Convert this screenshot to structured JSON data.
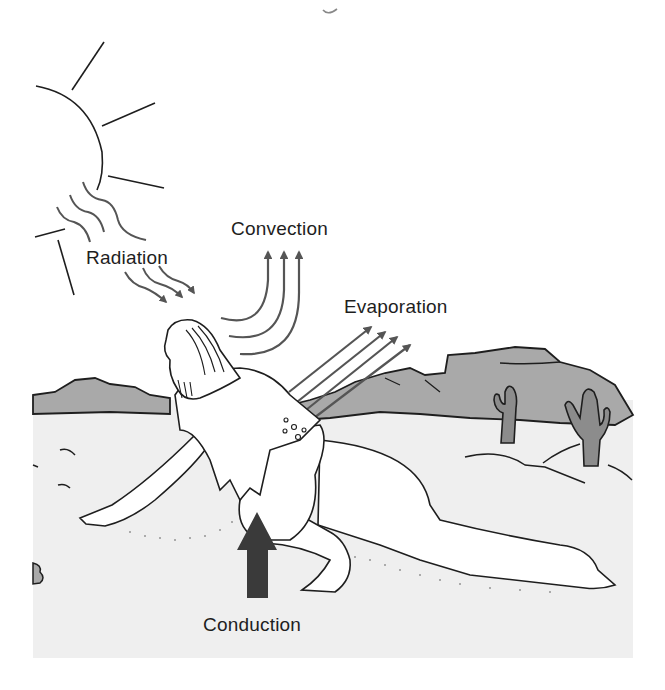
{
  "diagram": {
    "labels": {
      "radiation": "Radiation",
      "convection": "Convection",
      "evaporation": "Evaporation",
      "conduction": "Conduction"
    },
    "elements": [
      "sun",
      "radiation-waves",
      "convection-arrows",
      "evaporation-arrows",
      "conduction-arrow",
      "crawling-man",
      "desert-hills",
      "cacti",
      "sand-ground"
    ]
  },
  "colors": {
    "ink": "#1e1e1e",
    "arrow": "#555555",
    "conduction_arrow": "#3a3a3a",
    "hills": "#a9a9a9",
    "ground": "#efefef",
    "cactus": "#8c8c8c"
  }
}
